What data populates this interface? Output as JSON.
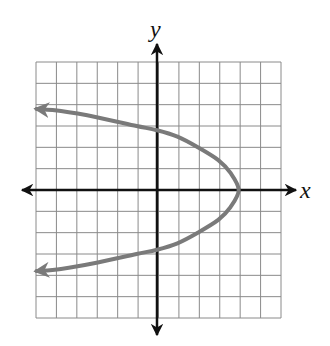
{
  "chart_data": {
    "type": "line",
    "title": "",
    "xlabel": "x",
    "ylabel": "y",
    "xlim": [
      -6,
      6
    ],
    "ylim": [
      -6,
      6
    ],
    "grid": true,
    "grid_units": 12,
    "curve": {
      "description": "Parabola opening left with vertex at (4, 0), arrows on both left ends",
      "vertex": [
        4,
        0
      ],
      "points": [
        [
          -5.9,
          3.8
        ],
        [
          -4.7,
          3.7
        ],
        [
          -2.9,
          3.4
        ],
        [
          -1.0,
          3.0
        ],
        [
          0,
          2.8
        ],
        [
          1.0,
          2.5
        ],
        [
          2.0,
          2.0
        ],
        [
          3.0,
          1.4
        ],
        [
          3.6,
          0.8
        ],
        [
          4.0,
          0
        ],
        [
          3.6,
          -0.8
        ],
        [
          3.0,
          -1.4
        ],
        [
          2.0,
          -2.0
        ],
        [
          1.0,
          -2.5
        ],
        [
          0,
          -2.8
        ],
        [
          -1.0,
          -3.0
        ],
        [
          -2.9,
          -3.4
        ],
        [
          -4.7,
          -3.7
        ],
        [
          -5.9,
          -3.8
        ]
      ],
      "color": "#7a7a7a"
    },
    "colors": {
      "grid": "#8a8a8a",
      "axes": "#111111",
      "curve": "#7a7a7a"
    }
  }
}
